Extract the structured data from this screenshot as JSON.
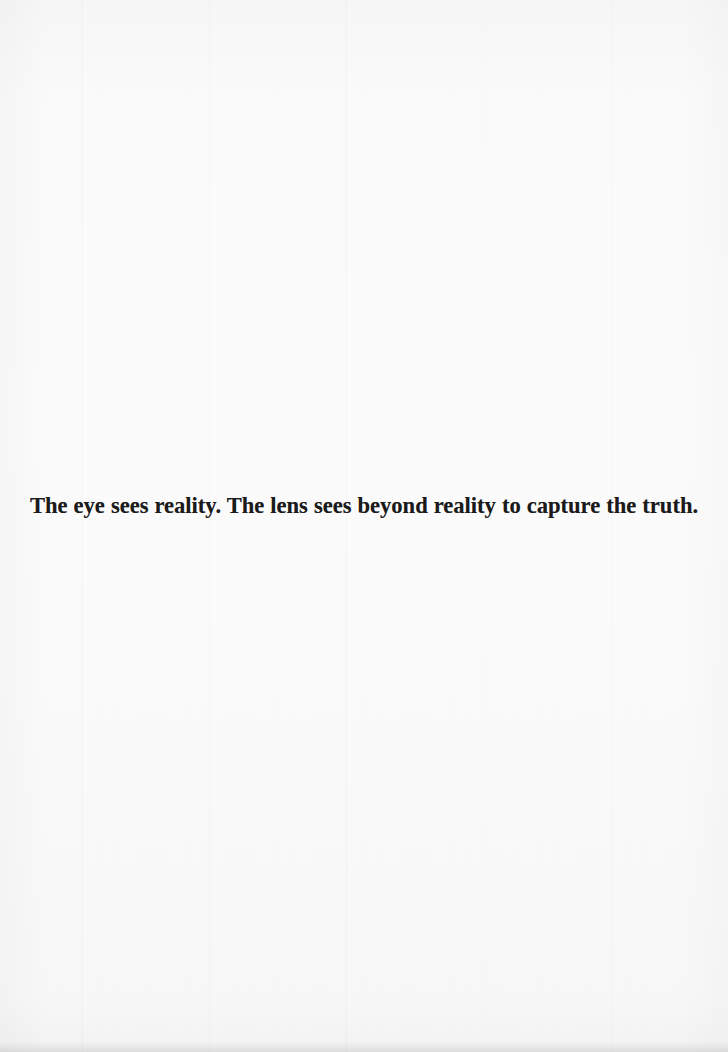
{
  "page": {
    "kind": "scanned-book-page",
    "width": 728,
    "height": 1052,
    "background_color": "#f9f9f9",
    "edge_shadow_color": "#e9e9ea"
  },
  "content": {
    "quote": "The eye sees reality. The lens sees beyond reality to capture the truth.",
    "text_color": "#1b1b1b",
    "alignment": "center"
  }
}
